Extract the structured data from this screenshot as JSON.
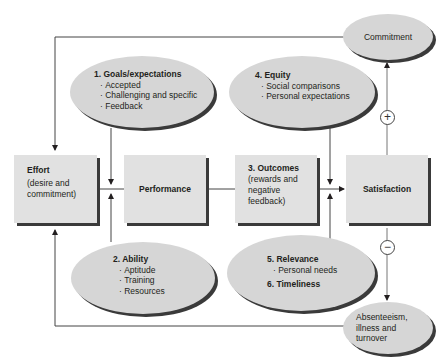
{
  "diagram": {
    "effort": {
      "title": "Effort",
      "subtitle_line1": "(desire and",
      "subtitle_line2": "commitment)"
    },
    "performance": {
      "title": "Performance"
    },
    "outcomes": {
      "title": "3. Outcomes",
      "subtitle_line1": "(rewards and",
      "subtitle_line2": "negative",
      "subtitle_line3": "feedback)"
    },
    "satisfaction": {
      "title": "Satisfaction"
    },
    "goals": {
      "title": "1. Goals/expectations",
      "items": [
        "Accepted",
        "Challenging and specific",
        "Feedback"
      ]
    },
    "ability": {
      "title": "2. Ability",
      "items": [
        "Aptitude",
        "Training",
        "Resources"
      ]
    },
    "equity": {
      "title": "4. Equity",
      "items": [
        "Social comparisons",
        "Personal expectations"
      ]
    },
    "relevance": {
      "title": "5. Relevance",
      "items": [
        "Personal needs"
      ],
      "title2": "6. Timeliness"
    },
    "commitment": {
      "title": "Commitment"
    },
    "absenteeism": {
      "line1": "Absenteeism,",
      "line2": "illness and",
      "line3": "turnover"
    },
    "signs": {
      "positive": "+",
      "negative": "−"
    }
  }
}
